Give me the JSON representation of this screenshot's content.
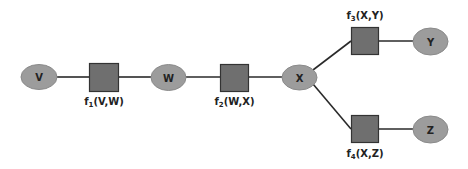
{
  "diagram": {
    "type": "factor-graph",
    "colors": {
      "variable_fill": "#9c9c9c",
      "factor_fill": "#6f6f6f",
      "factor_stroke": "#333333",
      "edge": "#2a2a2a",
      "text": "#222222"
    },
    "variables": [
      {
        "id": "V",
        "label": "V"
      },
      {
        "id": "W",
        "label": "W"
      },
      {
        "id": "X",
        "label": "X"
      },
      {
        "id": "Y",
        "label": "Y"
      },
      {
        "id": "Z",
        "label": "Z"
      }
    ],
    "factors": [
      {
        "id": "f1",
        "name": "f",
        "sub": "1",
        "args": "(V,W)"
      },
      {
        "id": "f2",
        "name": "f",
        "sub": "2",
        "args": "(W,X)"
      },
      {
        "id": "f3",
        "name": "f",
        "sub": "3",
        "args": "(X,Y)"
      },
      {
        "id": "f4",
        "name": "f",
        "sub": "4",
        "args": "(X,Z)"
      }
    ],
    "edges": [
      [
        "V",
        "f1"
      ],
      [
        "f1",
        "W"
      ],
      [
        "W",
        "f2"
      ],
      [
        "f2",
        "X"
      ],
      [
        "X",
        "f3"
      ],
      [
        "f3",
        "Y"
      ],
      [
        "X",
        "f4"
      ],
      [
        "f4",
        "Z"
      ]
    ]
  }
}
